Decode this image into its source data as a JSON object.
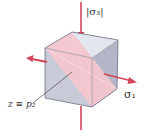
{
  "diagram": {
    "labels": {
      "sigma3": "|σ₃|",
      "sigma1": "σ₁",
      "plane": "z ≡ p₂"
    },
    "colors": {
      "arrow": "#d2455a",
      "plane_fill": "#f5c9cf",
      "cube_top": "#e6e8f0",
      "cube_left": "#c9cbd8",
      "cube_right": "#b9bccc",
      "edge": "#666a7a",
      "background": "#ffffff"
    },
    "arrows": [
      {
        "name": "sigma3-compression-top",
        "direction": "down"
      },
      {
        "name": "sigma3-compression-bottom",
        "direction": "up"
      },
      {
        "name": "sigma1-tension-right",
        "direction": "right"
      },
      {
        "name": "sigma1-tension-left",
        "direction": "left"
      }
    ]
  }
}
